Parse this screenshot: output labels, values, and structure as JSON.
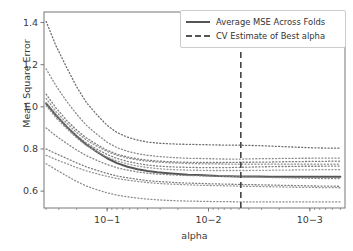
{
  "chart_data": {
    "type": "line",
    "title": "",
    "xlabel": "alpha",
    "ylabel": "Mean Square Error",
    "xscale": "log",
    "x_inverted": true,
    "xlim": [
      0.00045,
      0.42
    ],
    "ylim": [
      0.52,
      1.45
    ],
    "grid": false,
    "legend_position": "upper right",
    "xticks": [
      {
        "value": 0.1,
        "label": "10−1"
      },
      {
        "value": 0.01,
        "label": "10−2"
      },
      {
        "value": 0.001,
        "label": "10−3"
      }
    ],
    "yticks": [
      {
        "value": 0.6,
        "label": "0.6"
      },
      {
        "value": 0.8,
        "label": "0.8"
      },
      {
        "value": 1.0,
        "label": "1.0"
      },
      {
        "value": 1.2,
        "label": "1.2"
      },
      {
        "value": 1.4,
        "label": "1.4"
      }
    ],
    "annotations": [
      {
        "name": "cv-best-alpha-vline",
        "type": "vline",
        "x": 0.0048,
        "style": "dashed",
        "color": "#444444"
      }
    ],
    "x": [
      0.4,
      0.32,
      0.25,
      0.2,
      0.16,
      0.125,
      0.1,
      0.08,
      0.063,
      0.05,
      0.04,
      0.032,
      0.025,
      0.02,
      0.016,
      0.0125,
      0.01,
      0.008,
      0.0063,
      0.005,
      0.004,
      0.0032,
      0.0025,
      0.002,
      0.0016,
      0.00125,
      0.001,
      0.0008,
      0.00063,
      0.0005
    ],
    "series": [
      {
        "name": "Average MSE Across Folds",
        "style": "solid",
        "color": "#555555",
        "width": 2.0,
        "values": [
          1.015,
          0.96,
          0.905,
          0.86,
          0.82,
          0.785,
          0.756,
          0.733,
          0.716,
          0.704,
          0.696,
          0.69,
          0.685,
          0.681,
          0.678,
          0.676,
          0.674,
          0.672,
          0.671,
          0.67,
          0.669,
          0.669,
          0.668,
          0.668,
          0.668,
          0.668,
          0.668,
          0.668,
          0.668,
          0.668
        ]
      },
      {
        "name": "fold-1",
        "style": "dotted",
        "color": "#6e6e6e",
        "width": 1.0,
        "values": [
          1.405,
          1.29,
          1.185,
          1.095,
          1.02,
          0.96,
          0.912,
          0.878,
          0.856,
          0.842,
          0.833,
          0.828,
          0.825,
          0.823,
          0.822,
          0.821,
          0.82,
          0.819,
          0.818,
          0.818,
          0.817,
          0.816,
          0.814,
          0.812,
          0.81,
          0.808,
          0.806,
          0.805,
          0.804,
          0.804
        ]
      },
      {
        "name": "fold-2",
        "style": "dotted",
        "color": "#8a8a8a",
        "width": 1.0,
        "values": [
          1.18,
          1.1,
          1.025,
          0.965,
          0.912,
          0.868,
          0.832,
          0.806,
          0.789,
          0.778,
          0.77,
          0.765,
          0.761,
          0.758,
          0.756,
          0.755,
          0.754,
          0.753,
          0.752,
          0.752,
          0.753,
          0.754,
          0.754,
          0.755,
          0.755,
          0.756,
          0.756,
          0.757,
          0.757,
          0.757
        ]
      },
      {
        "name": "fold-3",
        "style": "dotted",
        "color": "#7a7a7a",
        "width": 1.0,
        "values": [
          1.06,
          0.995,
          0.935,
          0.89,
          0.852,
          0.82,
          0.794,
          0.775,
          0.762,
          0.753,
          0.747,
          0.743,
          0.74,
          0.738,
          0.737,
          0.736,
          0.736,
          0.736,
          0.736,
          0.737,
          0.737,
          0.738,
          0.738,
          0.739,
          0.74,
          0.74,
          0.741,
          0.741,
          0.742,
          0.742
        ]
      },
      {
        "name": "fold-4",
        "style": "dotted",
        "color": "#909090",
        "width": 1.0,
        "values": [
          1.04,
          0.978,
          0.922,
          0.878,
          0.842,
          0.812,
          0.788,
          0.77,
          0.757,
          0.748,
          0.742,
          0.738,
          0.735,
          0.733,
          0.731,
          0.73,
          0.729,
          0.729,
          0.728,
          0.728,
          0.728,
          0.728,
          0.728,
          0.728,
          0.728,
          0.728,
          0.728,
          0.728,
          0.728,
          0.728
        ]
      },
      {
        "name": "fold-5",
        "style": "dotted",
        "color": "#808080",
        "width": 1.0,
        "values": [
          1.02,
          0.962,
          0.908,
          0.864,
          0.828,
          0.798,
          0.774,
          0.755,
          0.741,
          0.731,
          0.724,
          0.719,
          0.716,
          0.714,
          0.713,
          0.712,
          0.712,
          0.712,
          0.712,
          0.713,
          0.714,
          0.715,
          0.716,
          0.717,
          0.717,
          0.718,
          0.718,
          0.718,
          0.719,
          0.719
        ]
      },
      {
        "name": "fold-6",
        "style": "dotted",
        "color": "#999999",
        "width": 1.0,
        "values": [
          1.005,
          0.948,
          0.896,
          0.852,
          0.816,
          0.786,
          0.762,
          0.743,
          0.729,
          0.719,
          0.712,
          0.707,
          0.703,
          0.701,
          0.7,
          0.699,
          0.698,
          0.698,
          0.698,
          0.698,
          0.698,
          0.699,
          0.699,
          0.7,
          0.7,
          0.701,
          0.701,
          0.702,
          0.702,
          0.702
        ]
      },
      {
        "name": "fold-7",
        "style": "dotted",
        "color": "#868686",
        "width": 1.0,
        "values": [
          0.9,
          0.862,
          0.826,
          0.795,
          0.768,
          0.745,
          0.726,
          0.711,
          0.7,
          0.691,
          0.685,
          0.681,
          0.678,
          0.676,
          0.674,
          0.673,
          0.672,
          0.671,
          0.67,
          0.669,
          0.668,
          0.667,
          0.665,
          0.664,
          0.663,
          0.662,
          0.661,
          0.66,
          0.66,
          0.66
        ]
      },
      {
        "name": "fold-8",
        "style": "dotted",
        "color": "#7c7c7c",
        "width": 1.0,
        "values": [
          0.8,
          0.778,
          0.755,
          0.734,
          0.715,
          0.698,
          0.684,
          0.672,
          0.663,
          0.656,
          0.65,
          0.646,
          0.643,
          0.64,
          0.638,
          0.637,
          0.635,
          0.634,
          0.633,
          0.632,
          0.631,
          0.63,
          0.629,
          0.628,
          0.627,
          0.626,
          0.625,
          0.624,
          0.624,
          0.623
        ]
      },
      {
        "name": "fold-9",
        "style": "dotted",
        "color": "#949494",
        "width": 1.0,
        "values": [
          0.77,
          0.75,
          0.73,
          0.712,
          0.696,
          0.682,
          0.67,
          0.66,
          0.652,
          0.646,
          0.641,
          0.637,
          0.634,
          0.632,
          0.63,
          0.628,
          0.627,
          0.626,
          0.625,
          0.624,
          0.623,
          0.622,
          0.621,
          0.62,
          0.619,
          0.618,
          0.618,
          0.617,
          0.617,
          0.616
        ]
      },
      {
        "name": "fold-10",
        "style": "dotted",
        "color": "#8e8e8e",
        "width": 1.0,
        "values": [
          0.73,
          0.702,
          0.672,
          0.646,
          0.624,
          0.606,
          0.592,
          0.581,
          0.573,
          0.567,
          0.562,
          0.559,
          0.556,
          0.554,
          0.553,
          0.552,
          0.551,
          0.55,
          0.55,
          0.549,
          0.549,
          0.549,
          0.549,
          0.549,
          0.549,
          0.549,
          0.549,
          0.549,
          0.549,
          0.549
        ]
      }
    ],
    "legend": [
      {
        "label": "Average MSE Across Folds",
        "style": "solid"
      },
      {
        "label": "CV Estimate of Best alpha",
        "style": "dashed"
      }
    ]
  },
  "axes": {
    "xlabel": "alpha",
    "ylabel": "Mean Square Error"
  },
  "legend": {
    "avg_label": "Average MSE Across Folds",
    "cv_label": "CV Estimate of Best alpha"
  },
  "ticks": {
    "x": [
      "10−1",
      "10−2",
      "10−3"
    ],
    "y": [
      "1.4",
      "1.2",
      "1.0",
      "0.8",
      "0.6"
    ]
  },
  "colors": {
    "axis": "#777777",
    "average_line": "#555555",
    "fold_line": "#888888",
    "vline": "#444444",
    "text": "#3a3a3a"
  }
}
